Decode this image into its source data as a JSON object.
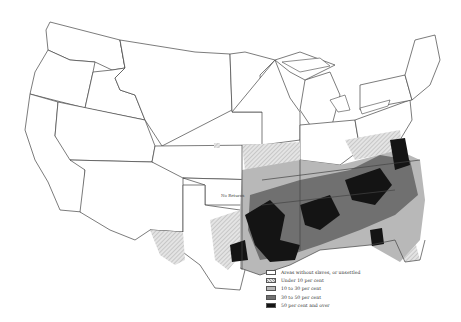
{
  "map": {
    "title": "",
    "region": "United States (1860)",
    "annotation": "No Returns",
    "colors": {
      "background": "#ffffff",
      "border": "#444444",
      "none": "#ffffff",
      "under_10": "#d8d8d8",
      "10_to_30": "#b8b8b8",
      "30_to_50": "#707070",
      "50_and_over": "#141414"
    }
  },
  "legend": {
    "items": [
      {
        "label": "Areas without slaves, or unsettled",
        "class": "none"
      },
      {
        "label": "Under 10 per cent",
        "class": "under_10"
      },
      {
        "label": "10 to 30 per cent",
        "class": "10_to_30"
      },
      {
        "label": "30 to 50 per cent",
        "class": "30_to_50"
      },
      {
        "label": "50 per cent and over",
        "class": "50_and_over"
      }
    ]
  }
}
